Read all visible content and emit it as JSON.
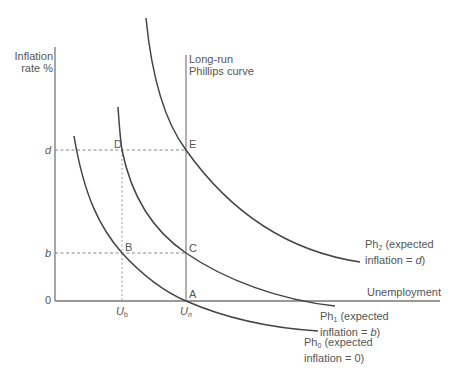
{
  "axes": {
    "y_label_line1": "Inflation",
    "y_label_line2": "rate %",
    "x_label": "Unemployment",
    "y_ticks": {
      "d": "d",
      "b": "b",
      "zero": "0"
    },
    "x_ticks": {
      "ub_main": "U",
      "ub_sub": "b",
      "un_main": "U",
      "un_sub": "n"
    }
  },
  "lrpc": {
    "line1": "Long-run",
    "line2": "Phillips curve"
  },
  "points": {
    "A": "A",
    "B": "B",
    "C": "C",
    "D": "D",
    "E": "E"
  },
  "curves": {
    "ph0": {
      "name": "Ph",
      "sub": "0",
      "line1_rest": " (expected",
      "line2": "inflation = 0)"
    },
    "ph1": {
      "name": "Ph",
      "sub": "1",
      "line1_rest": " (expected",
      "line2_pre": "inflation = ",
      "line2_var": "b",
      "line2_post": ")"
    },
    "ph2": {
      "name": "Ph",
      "sub": "2",
      "line1_rest": " (expected",
      "line2_pre": "inflation = ",
      "line2_var": "d",
      "line2_post": ")"
    }
  },
  "colors": {
    "axis": "#777777",
    "curve": "#444444",
    "dashed": "#888888",
    "text": "#555555"
  }
}
